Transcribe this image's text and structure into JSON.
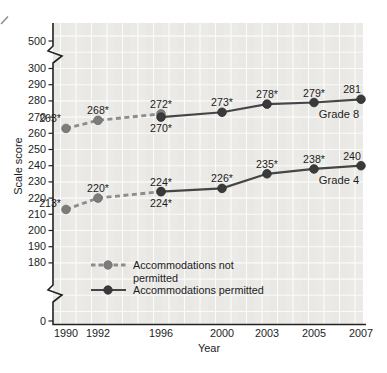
{
  "chart_data": {
    "type": "line",
    "title": "",
    "xlabel": "Year",
    "ylabel": "Scale score",
    "x_ticks": [
      "1990",
      "1992",
      "1996",
      "2000",
      "2003",
      "2005",
      "2007"
    ],
    "y_ticks": [
      "500",
      "300",
      "290",
      "280",
      "270",
      "260",
      "250",
      "240",
      "230",
      "220",
      "210",
      "200",
      "190",
      "180",
      "0"
    ],
    "y_axis_breaks": [
      "between 500 and 300",
      "between 180 and 0"
    ],
    "grid": "on",
    "colors": {
      "plot_bg": "#e9e8e5",
      "grid_line": "#ffffff",
      "axis": "#222222",
      "text": "#1c1c1c",
      "dashed_line": "#8d8d8d",
      "dashed_marker": "#7c7c7c",
      "solid_line": "#464646",
      "solid_marker": "#3a3a3a"
    },
    "series": [
      {
        "name": "Grade 8 accommodations not permitted",
        "grade": "Grade 8",
        "style": "dashed",
        "points": [
          {
            "x": "1990",
            "y": 263,
            "label": "263*",
            "label_pos": "left-up"
          },
          {
            "x": "1992",
            "y": 268,
            "label": "268*",
            "label_pos": "above"
          },
          {
            "x": "1996",
            "y": 272,
            "label": "272*",
            "label_pos": "above"
          }
        ]
      },
      {
        "name": "Grade 8 accommodations permitted",
        "grade": "Grade 8",
        "style": "solid",
        "points": [
          {
            "x": "1996",
            "y": 270,
            "label": "270*",
            "label_pos": "below"
          },
          {
            "x": "2000",
            "y": 273,
            "label": "273*",
            "label_pos": "above"
          },
          {
            "x": "2003",
            "y": 278,
            "label": "278*",
            "label_pos": "above"
          },
          {
            "x": "2005",
            "y": 279,
            "label": "279*",
            "label_pos": "above"
          },
          {
            "x": "2007",
            "y": 281,
            "label": "281",
            "label_pos": "above-left"
          }
        ]
      },
      {
        "name": "Grade 4 accommodations not permitted",
        "grade": "Grade 4",
        "style": "dashed",
        "points": [
          {
            "x": "1990",
            "y": 213,
            "label": "213*",
            "label_pos": "left-mid"
          },
          {
            "x": "1992",
            "y": 220,
            "label": "220*",
            "label_pos": "above"
          },
          {
            "x": "1996",
            "y": 224,
            "label": "224*",
            "label_pos": "above"
          }
        ]
      },
      {
        "name": "Grade 4 accommodations permitted",
        "grade": "Grade 4",
        "style": "solid",
        "points": [
          {
            "x": "1996",
            "y": 224,
            "label": "224*",
            "label_pos": "below"
          },
          {
            "x": "2000",
            "y": 226,
            "label": "226*",
            "label_pos": "above"
          },
          {
            "x": "2003",
            "y": 235,
            "label": "235*",
            "label_pos": "above"
          },
          {
            "x": "2005",
            "y": 238,
            "label": "238*",
            "label_pos": "above"
          },
          {
            "x": "2007",
            "y": 240,
            "label": "240",
            "label_pos": "above-left"
          }
        ]
      }
    ],
    "annotations": [
      {
        "text": "Grade 8"
      },
      {
        "text": "Grade 4"
      }
    ],
    "legend": {
      "position": "inside lower-left",
      "items": [
        {
          "style": "dashed",
          "label_lines": [
            "Accommodations not",
            "permitted"
          ]
        },
        {
          "style": "solid",
          "label_lines": [
            "Accommodations permitted"
          ]
        }
      ]
    }
  }
}
